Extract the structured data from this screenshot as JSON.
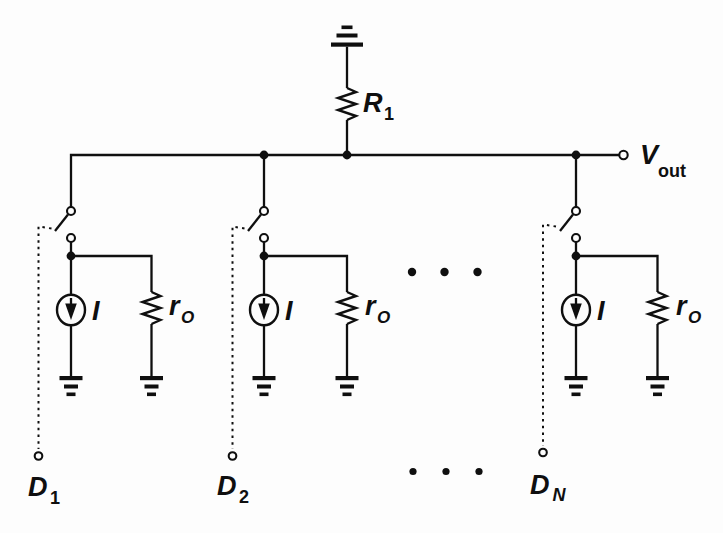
{
  "colors": {
    "ink": "#0f0f0f",
    "paper": "#fdfdfd"
  },
  "output_node": {
    "base": "V",
    "sub": "out"
  },
  "load_resistor": {
    "base": "R",
    "sub": "1"
  },
  "cells": [
    {
      "current_label": "I",
      "resistor": {
        "base": "r",
        "sub": "O"
      },
      "control": {
        "base": "D",
        "sub": "1"
      }
    },
    {
      "current_label": "I",
      "resistor": {
        "base": "r",
        "sub": "O"
      },
      "control": {
        "base": "D",
        "sub": "2"
      }
    },
    {
      "current_label": "I",
      "resistor": {
        "base": "r",
        "sub": "O"
      },
      "control": {
        "base": "D",
        "sub": "N"
      }
    }
  ]
}
